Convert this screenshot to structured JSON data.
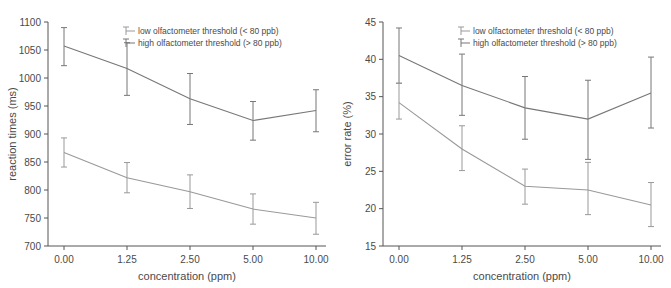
{
  "figure": {
    "background": "#ffffff",
    "axis_color": "#555555",
    "text_color": "#4a4a4a"
  },
  "legend": {
    "low_label": "low olfactometer threshold (< 80 ppb)",
    "high_label": "high olfactometer threshold (> 80 ppb)",
    "low_color": "#999999",
    "high_color": "#777777",
    "marker": "errorbar-glyph"
  },
  "chart_data": [
    {
      "type": "line",
      "panel": "left",
      "title": "",
      "xlabel": "concentration (ppm)",
      "ylabel": "reaction times (ms)",
      "categories": [
        "0.00",
        "1.25",
        "2.50",
        "5.00",
        "10.00"
      ],
      "ylim": [
        700,
        1100
      ],
      "yticks": [
        700,
        750,
        800,
        850,
        900,
        950,
        1000,
        1050,
        1100
      ],
      "grid": false,
      "legend_position": "top-center",
      "series": [
        {
          "name": "high olfactometer threshold (> 80 ppb)",
          "color": "#777777",
          "values": [
            1057,
            1017,
            963,
            924,
            942
          ],
          "error_low": [
            1022,
            969,
            917,
            889,
            904
          ],
          "error_high": [
            1090,
            1063,
            1008,
            958,
            979
          ]
        },
        {
          "name": "low olfactometer threshold (< 80 ppb)",
          "color": "#999999",
          "values": [
            867,
            822,
            797,
            766,
            750
          ],
          "error_low": [
            841,
            795,
            767,
            739,
            721
          ],
          "error_high": [
            893,
            849,
            827,
            793,
            778
          ]
        }
      ]
    },
    {
      "type": "line",
      "panel": "right",
      "title": "",
      "xlabel": "concentration (ppm)",
      "ylabel": "error rate (%)",
      "categories": [
        "0.00",
        "1.25",
        "2.50",
        "5.00",
        "10.00"
      ],
      "ylim": [
        15,
        45
      ],
      "yticks": [
        15,
        20,
        25,
        30,
        35,
        40,
        45
      ],
      "grid": false,
      "legend_position": "top-center",
      "series": [
        {
          "name": "high olfactometer threshold (> 80 ppb)",
          "color": "#777777",
          "values": [
            40.5,
            36.5,
            33.5,
            32.0,
            35.5
          ],
          "error_low": [
            36.8,
            32.5,
            29.3,
            26.6,
            30.8
          ],
          "error_high": [
            44.2,
            40.7,
            37.7,
            37.2,
            40.3
          ]
        },
        {
          "name": "low olfactometer threshold (< 80 ppb)",
          "color": "#999999",
          "values": [
            34.2,
            28.0,
            23.0,
            22.5,
            20.5
          ],
          "error_low": [
            32.0,
            25.1,
            20.6,
            19.2,
            17.6
          ],
          "error_high": [
            36.8,
            31.1,
            25.3,
            26.2,
            23.5
          ]
        }
      ]
    }
  ]
}
